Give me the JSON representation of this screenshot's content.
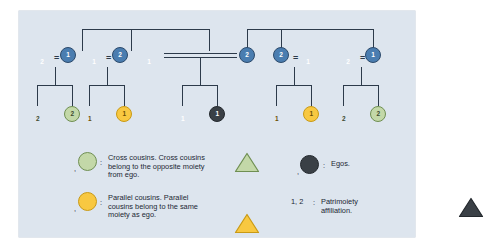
{
  "panel": {
    "background": "#dde5ee",
    "line_color": "#2c3a4a"
  },
  "palette": {
    "blue_fill": "#6f93b8",
    "blue_stroke": "#2c4a6b",
    "blue_circle_fill": "#4a7db0",
    "green_fill": "#c3d8a8",
    "green_stroke": "#6f8f52",
    "yellow_fill": "#f8c841",
    "yellow_stroke": "#c99a15",
    "dark_fill": "#3a4046",
    "dark_stroke": "#23282d",
    "label_light": "#ffffff",
    "label_dark": "#3d4a2e"
  },
  "generation1": {
    "nodes": [
      {
        "id": "g1-n1",
        "shape": "triangle",
        "color": "blue",
        "label": "2"
      },
      {
        "id": "g1-n2",
        "shape": "circle",
        "color": "blue",
        "label": "1"
      },
      {
        "id": "g1-n3",
        "shape": "triangle",
        "color": "blue",
        "label": "1"
      },
      {
        "id": "g1-n4",
        "shape": "circle",
        "color": "blue",
        "label": "2"
      },
      {
        "id": "g1-n5",
        "shape": "triangle",
        "color": "blue",
        "label": "1"
      },
      {
        "id": "g1-n6",
        "shape": "circle",
        "color": "blue",
        "label": "2"
      },
      {
        "id": "g1-n7",
        "shape": "circle",
        "color": "blue",
        "label": "2"
      },
      {
        "id": "g1-n8",
        "shape": "triangle",
        "color": "blue",
        "label": "1"
      },
      {
        "id": "g1-n9",
        "shape": "triangle",
        "color": "blue",
        "label": "2"
      },
      {
        "id": "g1-n10",
        "shape": "circle",
        "color": "blue",
        "label": "1"
      }
    ],
    "marriage_marks": [
      "=",
      "=",
      "=",
      "="
    ],
    "central_marriage": "double-line"
  },
  "generation2": {
    "nodes": [
      {
        "id": "g2-n1",
        "shape": "triangle",
        "color": "green",
        "label": "2",
        "role": "cross-cousin"
      },
      {
        "id": "g2-n2",
        "shape": "circle",
        "color": "green",
        "label": "2",
        "role": "cross-cousin"
      },
      {
        "id": "g2-n3",
        "shape": "triangle",
        "color": "yellow",
        "label": "1",
        "role": "parallel-cousin"
      },
      {
        "id": "g2-n4",
        "shape": "circle",
        "color": "yellow",
        "label": "1",
        "role": "parallel-cousin"
      },
      {
        "id": "g2-n5",
        "shape": "triangle",
        "color": "dark",
        "label": "1",
        "role": "ego"
      },
      {
        "id": "g2-n6",
        "shape": "circle",
        "color": "dark",
        "label": "1",
        "role": "ego"
      },
      {
        "id": "g2-n7",
        "shape": "triangle",
        "color": "yellow",
        "label": "1",
        "role": "parallel-cousin"
      },
      {
        "id": "g2-n8",
        "shape": "circle",
        "color": "yellow",
        "label": "1",
        "role": "parallel-cousin"
      },
      {
        "id": "g2-n9",
        "shape": "triangle",
        "color": "green",
        "label": "2",
        "role": "cross-cousin"
      },
      {
        "id": "g2-n10",
        "shape": "circle",
        "color": "green",
        "label": "2",
        "role": "cross-cousin"
      }
    ]
  },
  "legend": {
    "separator": ":",
    "comma": ",",
    "entries": [
      {
        "id": "cross-cousins",
        "symbols": [
          {
            "shape": "triangle",
            "color": "green"
          },
          {
            "shape": "circle",
            "color": "green"
          }
        ],
        "text": "Cross cousins. Cross cousins\nbelong to the opposite moiety\nfrom ego."
      },
      {
        "id": "parallel-cousins",
        "symbols": [
          {
            "shape": "triangle",
            "color": "yellow"
          },
          {
            "shape": "circle",
            "color": "yellow"
          }
        ],
        "text": "Parallel cousins. Parallel\ncousins belong to the same\nmoiety as ego."
      },
      {
        "id": "egos",
        "symbols": [
          {
            "shape": "triangle",
            "color": "dark"
          },
          {
            "shape": "circle",
            "color": "dark"
          }
        ],
        "text": "Egos."
      },
      {
        "id": "patrimoiety",
        "key": "1, 2",
        "text": "Patrimoiety\naffiliation."
      }
    ]
  }
}
